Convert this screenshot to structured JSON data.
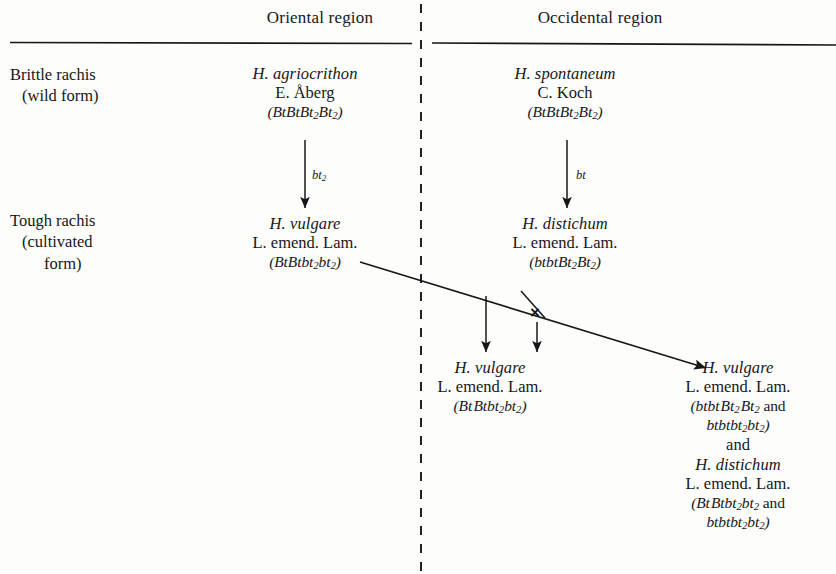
{
  "figure": {
    "type": "genetics-pedigree-diagram",
    "columns": [
      {
        "id": "oriental",
        "label": "Oriental region"
      },
      {
        "id": "occidental",
        "label": "Occidental region"
      }
    ],
    "row_labels": [
      {
        "id": "brittle",
        "line1": "Brittle rachis",
        "line2": "(wild form)"
      },
      {
        "id": "tough",
        "line1": "Tough rachis",
        "line2": "(cultivated",
        "line3": "form)"
      }
    ],
    "taxa": {
      "agriocrithon": {
        "species": "H. agriocrithon",
        "authority": "E. Åberg",
        "genotype_open": "(",
        "genotype": "BtBtBt2Bt2",
        "genotype_close": ")"
      },
      "spontaneum": {
        "species": "H. spontaneum",
        "authority": "C. Koch",
        "genotype_open": "(",
        "genotype": "BtBtBt2Bt2",
        "genotype_close": ")"
      },
      "vulgare_oriental": {
        "species": "H. vulgare",
        "authority": "L. emend. Lam.",
        "genotype_open": "(",
        "genotype": "BtBtbt2bt2",
        "genotype_close": ")"
      },
      "distichum_occidental": {
        "species": "H. distichum",
        "authority": "L. emend. Lam.",
        "genotype_open": "(",
        "genotype": "btbtBt2Bt2",
        "genotype_close": ")"
      },
      "vulgare_result_mid": {
        "species": "H. vulgare",
        "authority": "L. emend. Lam.",
        "genotype_open": "(",
        "genotype": "BtBtbt2bt2",
        "genotype_close": ")"
      },
      "vulgare_result_right": {
        "species": "H. vulgare",
        "authority": "L. emend. Lam.",
        "genotype_open": "(",
        "genotype_a": "btbtBt2Bt2",
        "genotype_join": "and",
        "genotype_b": "btbtbt2bt2",
        "genotype_close": ")"
      },
      "conjunction": "and",
      "distichum_result_right": {
        "species": "H. distichum",
        "authority": "L. emend. Lam.",
        "genotype_open": "(",
        "genotype_a": "BtBtbt2bt2",
        "genotype_join": "and",
        "genotype_b": "btbtbt2bt2",
        "genotype_close": ")"
      }
    },
    "mutation_arrows": [
      {
        "id": "oriental-mutation",
        "label": "bt2"
      },
      {
        "id": "occidental-mutation",
        "label": "bt"
      }
    ],
    "cross_symbol": "×",
    "ink_color": "#17171a"
  }
}
